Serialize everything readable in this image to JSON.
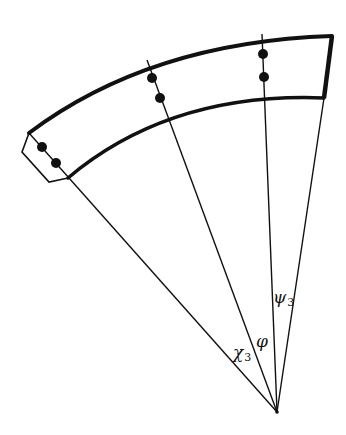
{
  "diagram": {
    "type": "sector-segment-schematic",
    "colors": {
      "stroke": "#111111",
      "background": "#ffffff"
    },
    "apex": {
      "x": 277,
      "y": 412
    },
    "labels": {
      "chi": {
        "symbol": "χ",
        "sub": "3"
      },
      "phi": {
        "symbol": "φ",
        "sub": ""
      },
      "psi": {
        "symbol": "ψ",
        "sub": "3"
      }
    },
    "dot_pairs": 3,
    "radial_lines": 4
  }
}
